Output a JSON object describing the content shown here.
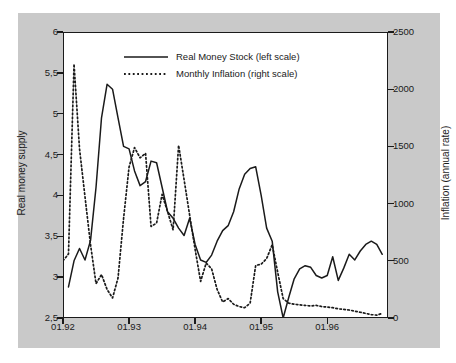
{
  "chart_data": {
    "type": "line",
    "title": "",
    "xlabel": "",
    "ylabel": "Real money supply",
    "y2label": "Inflation (annual rate)",
    "xlim": [
      1992.0,
      1996.92
    ],
    "ylim": [
      2.5,
      6
    ],
    "y2lim": [
      0,
      2500
    ],
    "grid": false,
    "legend_position": "top-center",
    "x_tick_labels": [
      "01.92",
      "01.93",
      "01.94",
      "01.95",
      "01.96"
    ],
    "x_tick_values": [
      1992.0,
      1993.0,
      1994.0,
      1995.0,
      1996.0
    ],
    "y_tick_labels": [
      "6",
      "5,5",
      "5",
      "4,5",
      "4",
      "3,5",
      "3",
      "2,5"
    ],
    "y_tick_values": [
      6,
      5.5,
      5,
      4.5,
      4,
      3.5,
      3,
      2.5
    ],
    "y2_tick_labels": [
      "2500",
      "2000",
      "1500",
      "1000",
      "500",
      "0"
    ],
    "y2_tick_values": [
      2500,
      2000,
      1500,
      1000,
      500,
      0
    ],
    "series": [
      {
        "name": "Real Money Stock (left scale)",
        "axis": "left",
        "style": "solid",
        "color": "#1a1a1a",
        "x": [
          1992.083,
          1992.167,
          1992.25,
          1992.333,
          1992.417,
          1992.5,
          1992.583,
          1992.667,
          1992.75,
          1992.833,
          1992.917,
          1993.0,
          1993.083,
          1993.167,
          1993.25,
          1993.333,
          1993.417,
          1993.5,
          1993.583,
          1993.667,
          1993.75,
          1993.833,
          1993.917,
          1994.0,
          1994.083,
          1994.167,
          1994.25,
          1994.333,
          1994.417,
          1994.5,
          1994.583,
          1994.667,
          1994.75,
          1994.833,
          1994.917,
          1995.0,
          1995.083,
          1995.167,
          1995.25,
          1995.333,
          1995.417,
          1995.5,
          1995.583,
          1995.667,
          1995.75,
          1995.833,
          1995.917,
          1996.0,
          1996.083,
          1996.167,
          1996.25,
          1996.333,
          1996.417,
          1996.5,
          1996.583,
          1996.667,
          1996.75,
          1996.833
        ],
        "y": [
          2.88,
          3.2,
          3.35,
          3.21,
          3.45,
          4.1,
          4.95,
          5.36,
          5.3,
          4.95,
          4.6,
          4.57,
          4.3,
          4.12,
          4.17,
          4.42,
          4.4,
          4.1,
          3.8,
          3.72,
          3.6,
          3.51,
          3.72,
          3.4,
          3.21,
          3.18,
          3.27,
          3.44,
          3.57,
          3.63,
          3.8,
          4.08,
          4.26,
          4.33,
          4.35,
          4.0,
          3.6,
          3.44,
          2.82,
          2.5,
          2.75,
          2.98,
          3.1,
          3.14,
          3.12,
          3.02,
          2.99,
          3.02,
          3.25,
          2.96,
          3.11,
          3.28,
          3.21,
          3.32,
          3.4,
          3.44,
          3.4,
          3.28
        ]
      },
      {
        "name": "Monthly Inflation (right scale)",
        "axis": "right",
        "style": "dotted",
        "color": "#1a1a1a",
        "x": [
          1992.0,
          1992.083,
          1992.167,
          1992.25,
          1992.333,
          1992.417,
          1992.5,
          1992.583,
          1992.667,
          1992.75,
          1992.833,
          1992.917,
          1993.0,
          1993.083,
          1993.167,
          1993.25,
          1993.333,
          1993.417,
          1993.5,
          1993.583,
          1993.667,
          1993.75,
          1993.833,
          1993.917,
          1994.0,
          1994.083,
          1994.167,
          1994.25,
          1994.333,
          1994.417,
          1994.5,
          1994.583,
          1994.667,
          1994.75,
          1994.833,
          1994.917,
          1995.0,
          1995.083,
          1995.167,
          1995.25,
          1995.333,
          1995.417,
          1995.5,
          1995.583,
          1995.667,
          1995.75,
          1995.833,
          1995.917,
          1996.0,
          1996.083,
          1996.167,
          1996.25,
          1996.333,
          1996.417,
          1996.5,
          1996.583,
          1996.667,
          1996.75,
          1996.833
        ],
        "y": [
          500,
          560,
          2220,
          1480,
          1060,
          640,
          300,
          380,
          250,
          175,
          350,
          870,
          1320,
          1490,
          1400,
          1440,
          800,
          830,
          1080,
          930,
          770,
          1510,
          1210,
          900,
          600,
          320,
          480,
          430,
          250,
          140,
          170,
          120,
          100,
          90,
          130,
          460,
          470,
          520,
          640,
          400,
          170,
          130,
          120,
          115,
          110,
          105,
          110,
          100,
          95,
          90,
          80,
          75,
          70,
          60,
          50,
          40,
          30,
          25,
          40
        ]
      }
    ]
  },
  "legend": {
    "items": [
      {
        "label": "Real Money Stock (left scale)",
        "style": "solid"
      },
      {
        "label": "Monthly Inflation (right scale)",
        "style": "dotted"
      }
    ]
  },
  "colors": {
    "panel_background": "#c9c9c9",
    "plot_background": "#ffffff",
    "axis": "#1a1a1a",
    "series_line": "#1a1a1a"
  }
}
